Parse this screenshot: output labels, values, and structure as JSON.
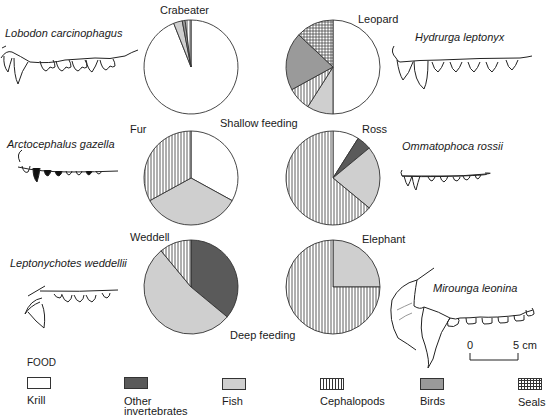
{
  "chart_data": {
    "type": "pie",
    "title": "",
    "legend_title": "FOOD",
    "legend": [
      {
        "key": "krill",
        "label": "Krill",
        "pattern": "white"
      },
      {
        "key": "other_invertebrates",
        "label": "Other invertebrates",
        "pattern": "dark-grey"
      },
      {
        "key": "fish",
        "label": "Fish",
        "pattern": "light-grey"
      },
      {
        "key": "cephalopods",
        "label": "Cephalopods",
        "pattern": "vertical-hatch"
      },
      {
        "key": "birds",
        "label": "Birds",
        "pattern": "mid-grey"
      },
      {
        "key": "seals",
        "label": "Seals",
        "pattern": "crosshatch"
      }
    ],
    "annotations": [
      "Shallow feeding",
      "Deep feeding"
    ],
    "pies": [
      {
        "name": "Crabeater",
        "species": "Lobodon carcinophagus",
        "feeding": "shallow",
        "slices": [
          {
            "food": "krill",
            "value": 94
          },
          {
            "food": "fish",
            "value": 3
          },
          {
            "food": "birds",
            "value": 1
          },
          {
            "food": "cephalopods",
            "value": 2
          }
        ]
      },
      {
        "name": "Leopard",
        "species": "Hydrurga leptonyx",
        "feeding": "shallow",
        "slices": [
          {
            "food": "krill",
            "value": 50
          },
          {
            "food": "fish",
            "value": 9
          },
          {
            "food": "cephalopods",
            "value": 8
          },
          {
            "food": "birds",
            "value": 20
          },
          {
            "food": "seals",
            "value": 13
          }
        ]
      },
      {
        "name": "Fur",
        "species": "Arctocephalus gazella",
        "feeding": "shallow",
        "slices": [
          {
            "food": "krill",
            "value": 33
          },
          {
            "food": "fish",
            "value": 34
          },
          {
            "food": "cephalopods",
            "value": 33
          }
        ]
      },
      {
        "name": "Ross",
        "species": "Ommatophoca rossii",
        "feeding": "shallow",
        "slices": [
          {
            "food": "krill",
            "value": 9
          },
          {
            "food": "other_invertebrates",
            "value": 5
          },
          {
            "food": "fish",
            "value": 22
          },
          {
            "food": "cephalopods",
            "value": 64
          }
        ]
      },
      {
        "name": "Weddell",
        "species": "Leptonychotes weddellii",
        "feeding": "deep",
        "slices": [
          {
            "food": "other_invertebrates",
            "value": 36
          },
          {
            "food": "fish",
            "value": 53
          },
          {
            "food": "cephalopods",
            "value": 11
          }
        ]
      },
      {
        "name": "Elephant",
        "species": "Mirounga leonina",
        "feeding": "deep",
        "slices": [
          {
            "food": "fish",
            "value": 25
          },
          {
            "food": "cephalopods",
            "value": 75
          }
        ]
      }
    ],
    "scale_bar": {
      "start": "0",
      "end": "5 cm"
    }
  },
  "labels": {
    "crabeater": "Crabeater",
    "leopard": "Leopard",
    "fur": "Fur",
    "ross": "Ross",
    "weddell": "Weddell",
    "elephant": "Elephant",
    "shallow": "Shallow feeding",
    "deep": "Deep feeding",
    "sp_crabeater": "Lobodon  carcinophagus",
    "sp_leopard": "Hydrurga leptonyx",
    "sp_fur": "Arctocephalus gazella",
    "sp_ross": "Ommatophoca rossii",
    "sp_weddell": "Leptonychotes weddellii",
    "sp_elephant": "Mirounga leonina",
    "scale_zero": "0",
    "scale_end": "5 cm"
  },
  "legend": {
    "title": "FOOD",
    "krill": "Krill",
    "other_1": "Other",
    "other_2": "invertebrates",
    "fish": "Fish",
    "cephalopods": "Cephalopods",
    "birds": "Birds",
    "seals": "Seals"
  },
  "colors": {
    "krill": "#ffffff",
    "other_invertebrates": "#5a5a5a",
    "fish": "#cfcfcf",
    "birds": "#9a9a9a",
    "outline": "#333333"
  }
}
